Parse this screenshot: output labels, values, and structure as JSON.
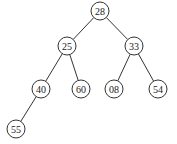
{
  "diagram": {
    "type": "binary-tree",
    "nodes": [
      {
        "id": "n28",
        "label": "28",
        "x": 100,
        "y": 11
      },
      {
        "id": "n25",
        "label": "25",
        "x": 67,
        "y": 46
      },
      {
        "id": "n33",
        "label": "33",
        "x": 134,
        "y": 46
      },
      {
        "id": "n40",
        "label": "40",
        "x": 41,
        "y": 89
      },
      {
        "id": "n60",
        "label": "60",
        "x": 81,
        "y": 89
      },
      {
        "id": "n08",
        "label": "08",
        "x": 114,
        "y": 89
      },
      {
        "id": "n54",
        "label": "54",
        "x": 158,
        "y": 89
      },
      {
        "id": "n55",
        "label": "55",
        "x": 16,
        "y": 129
      }
    ],
    "edges": [
      [
        "n28",
        "n25"
      ],
      [
        "n28",
        "n33"
      ],
      [
        "n25",
        "n40"
      ],
      [
        "n25",
        "n60"
      ],
      [
        "n33",
        "n08"
      ],
      [
        "n33",
        "n54"
      ],
      [
        "n40",
        "n55"
      ]
    ]
  }
}
